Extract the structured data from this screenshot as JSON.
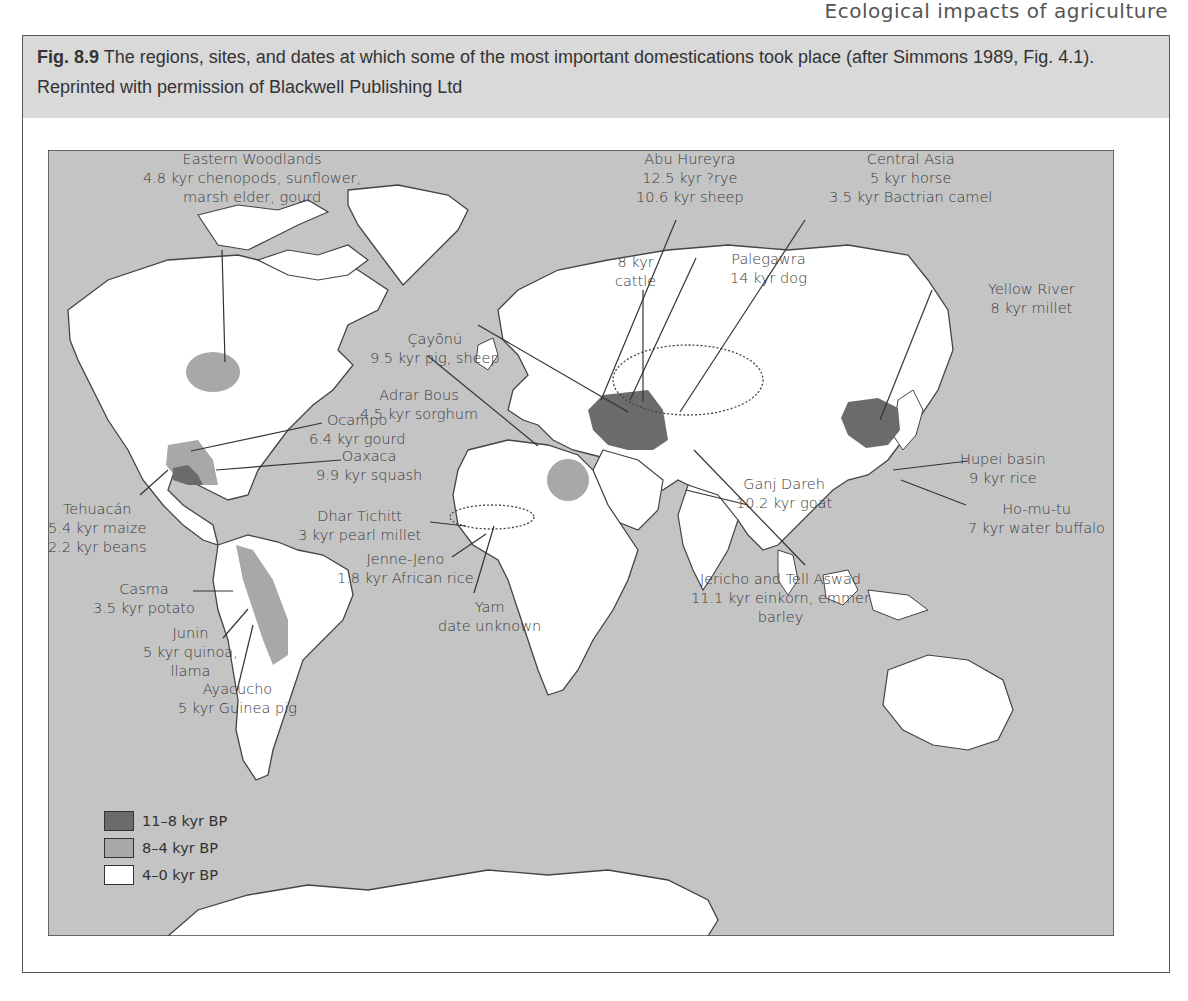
{
  "running_head": "Ecological impacts of agriculture",
  "caption": {
    "figure_number": "Fig. 8.9",
    "text": "The regions, sites, and dates at which some of the most important domestications took place (after Simmons 1989, Fig. 4.1). Reprinted with permission of Blackwell Publishing Ltd"
  },
  "colors": {
    "ocean": "#c4c4c4",
    "land": "#ffffff",
    "early": "#6b6b6b",
    "middle": "#a8a8a8",
    "late": "#ffffff",
    "outline": "#444444"
  },
  "legend": [
    {
      "label": "11–8 kyr BP",
      "color": "#6b6b6b"
    },
    {
      "label": "8–4 kyr BP",
      "color": "#a8a8a8"
    },
    {
      "label": "4–0 kyr BP",
      "color": "#ffffff"
    }
  ],
  "labels": {
    "eastern_woodlands": {
      "name": "Eastern Woodlands",
      "line1": "4.8 kyr chenopods, sunflower,",
      "line2": "marsh elder, gourd"
    },
    "abu_hureyra": {
      "name": "Abu Hureyra",
      "line1": "12.5 kyr ?rye",
      "line2": "10.6 kyr sheep"
    },
    "central_asia": {
      "name": "Central Asia",
      "line1": "5 kyr horse",
      "line2": "3.5 kyr Bactrian camel"
    },
    "palegawra": {
      "name": "Palegawra",
      "line1": "14 kyr dog"
    },
    "cattle": {
      "line1": "8 kyr",
      "line2": "cattle"
    },
    "cayonu": {
      "name": "Çayõnü",
      "line1": "9.5 kyr pig, sheep"
    },
    "yellow_river": {
      "name": "Yellow River",
      "line1": "8 kyr millet"
    },
    "adrar_bous": {
      "name": "Adrar Bous",
      "line1": "4.5 kyr sorghum"
    },
    "ocampo": {
      "name": "Ocampo",
      "line1": "6.4 kyr gourd"
    },
    "oaxaca": {
      "name": "Oaxaca",
      "line1": "9.9 kyr squash"
    },
    "hupei": {
      "name": "Hupei basin",
      "line1": "9 kyr rice"
    },
    "ganj_dareh": {
      "name": "Ganj Dareh",
      "line1": "10.2 kyr goat"
    },
    "ho_mu_tu": {
      "name": "Ho-mu-tu",
      "line1": "7 kyr water buffalo"
    },
    "tehuacan": {
      "name": "Tehuacán",
      "line1": "5.4 kyr maize",
      "line2": "2.2 kyr beans"
    },
    "dhar_tichitt": {
      "name": "Dhar Tichitt",
      "line1": "3 kyr pearl millet"
    },
    "jenne_jeno": {
      "name": "Jenne-Jeno",
      "line1": "1.8 kyr African rice"
    },
    "casma": {
      "name": "Casma",
      "line1": "3.5 kyr potato"
    },
    "jericho": {
      "name": "Jericho and Tell Aswad",
      "line1": "11.1 kyr einkorn, emmer",
      "line2": "barley"
    },
    "yam": {
      "name": "Yam",
      "line1": "date unknown"
    },
    "junin": {
      "name": "Junin",
      "line1": "5 kyr quinoa,",
      "line2": "llama"
    },
    "ayacucho": {
      "name": "Ayacucho",
      "line1": "5 kyr Guinea pig"
    }
  }
}
